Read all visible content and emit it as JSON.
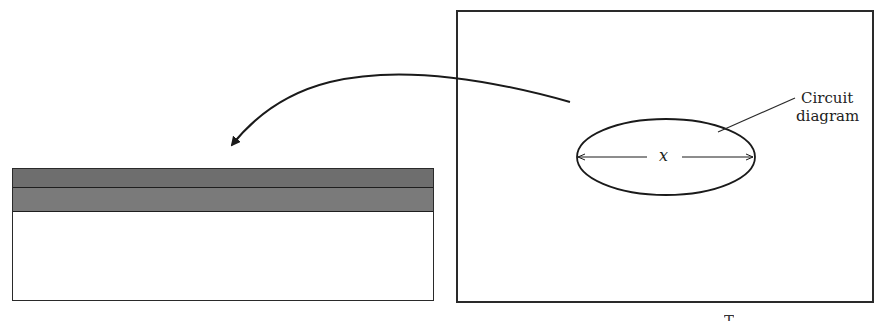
{
  "diagram": {
    "wafer": {
      "layers": [
        {
          "name": "top-layer",
          "color": "#6e6e6e"
        },
        {
          "name": "second-layer",
          "color": "#7a7a7a"
        }
      ],
      "substrate_color": "#ffffff"
    },
    "template": {
      "feature_label": "Circuit diagram",
      "feature_label_line1": "Circuit",
      "feature_label_line2": "diagram",
      "dimension_label": "x"
    },
    "arrow": {
      "direction": "template-to-wafer"
    },
    "caption_partial": "T"
  }
}
